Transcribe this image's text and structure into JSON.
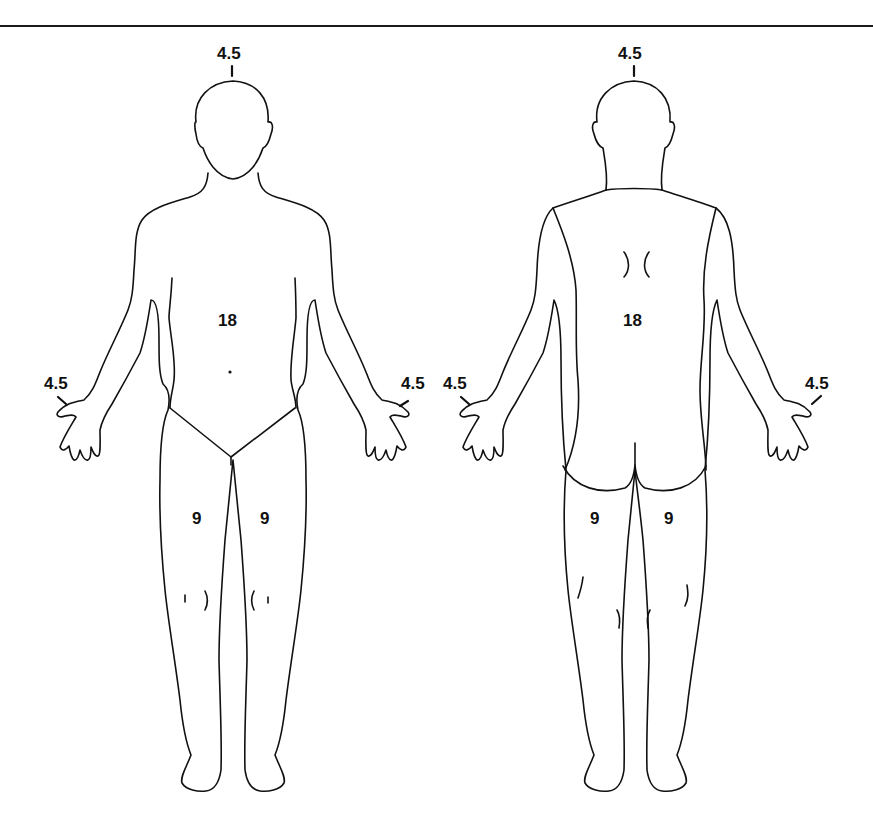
{
  "diagram": {
    "line_color": "#111111",
    "background": "#ffffff",
    "anterior": {
      "head": "4.5",
      "trunk": "18",
      "left_arm": "4.5",
      "right_arm": "4.5",
      "left_leg": "9",
      "right_leg": "9"
    },
    "posterior": {
      "head": "4.5",
      "trunk": "18",
      "left_arm": "4.5",
      "right_arm": "4.5",
      "left_leg": "9",
      "right_leg": "9"
    }
  }
}
